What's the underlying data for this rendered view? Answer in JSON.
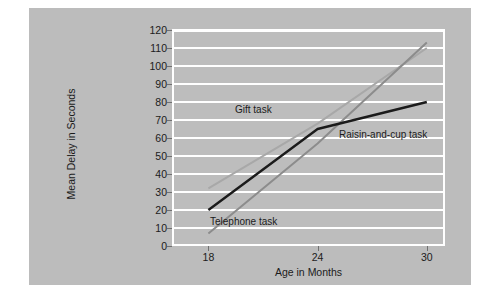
{
  "chart_data": {
    "type": "line",
    "title": "",
    "xlabel": "Age in Months",
    "ylabel": "Mean Delay in Seconds",
    "x": [
      18,
      24,
      30
    ],
    "xticklabels": [
      "18",
      "24",
      "30"
    ],
    "xlim": [
      16,
      31
    ],
    "ylim": [
      0,
      120
    ],
    "yticks": [
      0,
      10,
      20,
      30,
      40,
      50,
      60,
      70,
      80,
      90,
      100,
      110,
      120
    ],
    "yticklabels": [
      "0",
      "10",
      "20",
      "30",
      "40",
      "50",
      "60",
      "70",
      "80",
      "90",
      "100",
      "110",
      "120"
    ],
    "grid": "horizontal",
    "legend_position": "inline-annotations",
    "series": [
      {
        "name": "Gift task",
        "values": [
          32,
          68,
          110
        ],
        "color": "#a8a8a8",
        "label_text": "Gift task",
        "label_x": 206,
        "label_y": 96
      },
      {
        "name": "Telephone task",
        "values": [
          7,
          57,
          113
        ],
        "color": "#8c8c8c",
        "label_text": "Telephone task",
        "label_x": 181,
        "label_y": 208
      },
      {
        "name": "Raisin-and-cup task",
        "values": [
          20,
          65,
          80
        ],
        "color": "#1b1b1b",
        "label_text": "Raisin-and-cup task",
        "label_x": 310,
        "label_y": 121
      }
    ],
    "plot_background": "#bdbdbd",
    "figure_background": "#bcbcbc",
    "gridline_color": "#ffffff",
    "page_background": "#ffffff"
  }
}
